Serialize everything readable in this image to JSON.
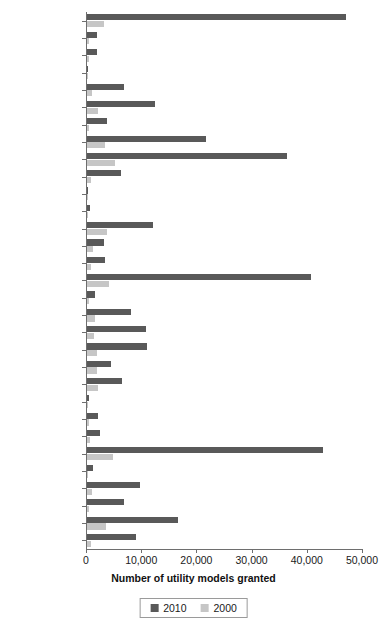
{
  "chart_data": {
    "type": "bar",
    "orientation": "horizontal",
    "title": "",
    "xlabel": "Number of utility models granted",
    "ylabel": "",
    "xlim": [
      0,
      50000
    ],
    "xticks": [
      0,
      10000,
      20000,
      30000,
      40000,
      50000
    ],
    "xticklabels": [
      "0",
      "10,000",
      "20,000",
      "30,000",
      "40,000",
      "50,000"
    ],
    "grid": false,
    "legend_position": "bottom",
    "colors": {
      "2010": "#595959",
      "2000": "#c6c6c6",
      "axis": "#6e6e6e",
      "text": "#1a1a1a",
      "background": "#ffffff"
    },
    "categories": [
      "Zhejiang",
      "Yunnan",
      "Xinjiang",
      "Tibet",
      "Tianjin",
      "Sichuan",
      "Shanxi",
      "Shanghai",
      "Shandong",
      "Shaanxi",
      "Qinghai",
      "Ningxia",
      "Liaoning",
      "Jilin",
      "Jiangxi",
      "Jiangsu",
      "Inner Mongolia",
      "Hunan",
      "Hubei",
      "Henan",
      "Heilongjiang",
      "Hebei",
      "Hainan",
      "Guizhou",
      "Guangxi",
      "Guangdong",
      "Gansu",
      "Fujian",
      "Chongqing",
      "Beijing",
      "Anhui"
    ],
    "series": [
      {
        "name": "2010",
        "color": "#595959",
        "values": [
          47000,
          1800,
          1800,
          150,
          6700,
          12400,
          3700,
          21500,
          36200,
          6200,
          250,
          500,
          12000,
          3000,
          3200,
          40500,
          1500,
          8000,
          10700,
          10900,
          4400,
          6400,
          350,
          2000,
          2400,
          42800,
          1100,
          9600,
          6700,
          16500,
          8900
        ]
      },
      {
        "name": "2000",
        "color": "#c6c6c6",
        "values": [
          3100,
          450,
          350,
          40,
          900,
          2000,
          400,
          3200,
          5000,
          750,
          60,
          130,
          3600,
          1100,
          700,
          4000,
          350,
          1400,
          1200,
          1900,
          1800,
          2000,
          120,
          300,
          500,
          4700,
          250,
          900,
          450,
          3500,
          750
        ]
      }
    ]
  },
  "legend": {
    "entries": [
      {
        "label": "2010",
        "color": "#595959"
      },
      {
        "label": "2000",
        "color": "#c6c6c6"
      }
    ]
  }
}
